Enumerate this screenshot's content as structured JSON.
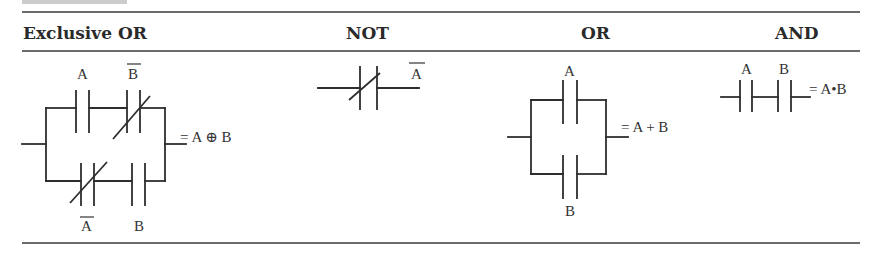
{
  "header": {
    "columns": [
      {
        "label": "Exclusive OR"
      },
      {
        "label": "NOT"
      },
      {
        "label": "OR"
      },
      {
        "label": "AND"
      }
    ]
  },
  "xor": {
    "top_contact_1": {
      "label": "A",
      "type": "normally-open"
    },
    "top_contact_2": {
      "label": "B",
      "negated": true,
      "type": "normally-closed"
    },
    "bottom_contact_1": {
      "label": "A",
      "negated": true,
      "type": "normally-closed"
    },
    "bottom_contact_2": {
      "label": "B",
      "type": "normally-open"
    },
    "output": "= A ⊕ B"
  },
  "not": {
    "contact": {
      "label": "A",
      "negated": true,
      "type": "normally-closed"
    }
  },
  "or": {
    "top_contact": {
      "label": "A",
      "type": "normally-open"
    },
    "bottom_contact": {
      "label": "B",
      "type": "normally-open"
    },
    "output": "= A + B"
  },
  "and": {
    "contact_1": {
      "label": "A",
      "type": "normally-open"
    },
    "contact_2": {
      "label": "B",
      "type": "normally-open"
    },
    "output": "= A•B"
  },
  "colors": {
    "line": "#2e2e2e",
    "text": "#2a2a2a",
    "background": "#ffffff"
  }
}
